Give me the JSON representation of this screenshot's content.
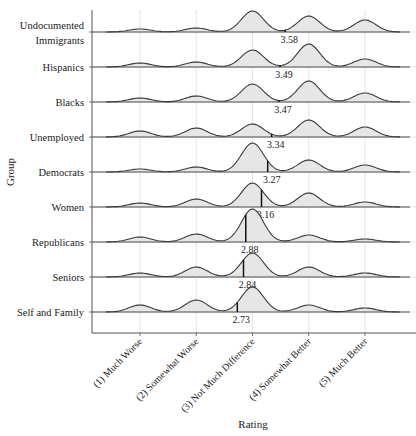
{
  "chart_data": {
    "type": "ridgeline",
    "title": "",
    "xlabel": "Rating",
    "ylabel": "Group",
    "x_categories": [
      "(1) Much Worse",
      "(2) Somewhat Worse",
      "(3) Not Much Difference",
      "(4) Somewhat Better",
      "(5) Much Better"
    ],
    "x_values": [
      1,
      2,
      3,
      4,
      5
    ],
    "grid": true,
    "legend": "none",
    "series": [
      {
        "name": "Undocumented Immigrants",
        "label_lines": [
          "Undocumented",
          "Immigrants"
        ],
        "mean": 3.58,
        "density_peaks": [
          3,
          4,
          21,
          16,
          12
        ]
      },
      {
        "name": "Hispanics",
        "label_lines": [
          "Hispanics"
        ],
        "mean": 3.49,
        "density_peaks": [
          4,
          5,
          17,
          23,
          8
        ]
      },
      {
        "name": "Blacks",
        "label_lines": [
          "Blacks"
        ],
        "mean": 3.47,
        "density_peaks": [
          4,
          6,
          18,
          21,
          9
        ]
      },
      {
        "name": "Unemployed",
        "label_lines": [
          "Unemployed"
        ],
        "mean": 3.34,
        "density_peaks": [
          6,
          9,
          13,
          17,
          10
        ]
      },
      {
        "name": "Democrats",
        "label_lines": [
          "Democrats"
        ],
        "mean": 3.27,
        "density_peaks": [
          3,
          5,
          29,
          12,
          7
        ]
      },
      {
        "name": "Women",
        "label_lines": [
          "Women"
        ],
        "mean": 3.16,
        "density_peaks": [
          4,
          8,
          24,
          14,
          5
        ]
      },
      {
        "name": "Republicans",
        "label_lines": [
          "Republicans"
        ],
        "mean": 2.88,
        "density_peaks": [
          5,
          8,
          33,
          7,
          3
        ]
      },
      {
        "name": "Seniors",
        "label_lines": [
          "Seniors"
        ],
        "mean": 2.84,
        "density_peaks": [
          4,
          10,
          24,
          10,
          4
        ]
      },
      {
        "name": "Self and Family",
        "label_lines": [
          "Self and Family"
        ],
        "mean": 2.73,
        "density_peaks": [
          7,
          12,
          25,
          7,
          4
        ]
      }
    ],
    "mean_labels": [
      "3.58",
      "3.49",
      "3.47",
      "3.34",
      "3.27",
      "3.16",
      "2.88",
      "2.84",
      "2.73"
    ]
  },
  "axis": {
    "x_title": "Rating",
    "y_title": "Group"
  },
  "colors": {
    "fill": "#e6e6e6",
    "line": "#3a3a3a",
    "grid": "#dcdcdc",
    "axis": "#555555",
    "mean_line": "#111111"
  }
}
